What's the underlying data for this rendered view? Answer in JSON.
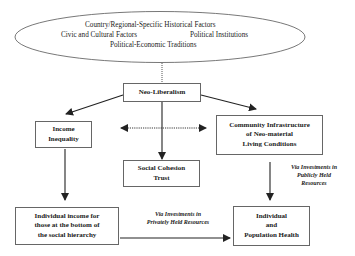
{
  "context_ellipse": {
    "line1": "Country/Regional-Specific Historical Factors",
    "line2_left": "Civic and Cultural Factors",
    "line2_right": "Political Institutions",
    "line3": "Political-Economic Traditions"
  },
  "nodes": {
    "neoliberalism": {
      "label": "Neo-Liberalism"
    },
    "income_inequality": {
      "line1": "Income",
      "line2": "Inequality"
    },
    "community_infrastructure": {
      "line1": "Community Infrastructure",
      "line2": "of Neo-material",
      "line3": "Living Conditions"
    },
    "social_cohesion": {
      "line1": "Social Cohesion",
      "line2": "Trust"
    },
    "individual_income": {
      "line1": "Individual income for",
      "line2": "those at the bottom of",
      "line3": "the social hierarchy"
    },
    "health": {
      "line1": "Individual",
      "line2": "and",
      "line3": "Population Health"
    }
  },
  "edge_labels": {
    "public": {
      "line1": "Via Investments in",
      "line2": "Publicly Held",
      "line3": "Resources"
    },
    "private": {
      "line1": "Via Investments in",
      "line2": "Privately Held Resources"
    }
  },
  "colors": {
    "line": "#222222",
    "border": "#666666",
    "background": "#ffffff"
  }
}
